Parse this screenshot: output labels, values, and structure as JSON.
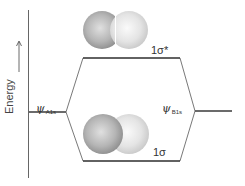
{
  "diagram": {
    "type": "molecular-orbital-energy-diagram",
    "axis": {
      "label": "Energy",
      "direction": "up"
    },
    "atomic_orbitals": [
      {
        "id": "left",
        "symbol": "ψ",
        "subscript": "A1s"
      },
      {
        "id": "right",
        "symbol": "ψ",
        "subscript": "B1s"
      }
    ],
    "molecular_orbitals": [
      {
        "id": "antibonding",
        "label": "1σ*",
        "level": "high"
      },
      {
        "id": "bonding",
        "label": "1σ",
        "level": "low"
      }
    ],
    "colors": {
      "line": "#3a3a3a",
      "axis": "#555555",
      "sphere_left": "#b8b8b8",
      "sphere_right": "#e6e6e6"
    }
  }
}
